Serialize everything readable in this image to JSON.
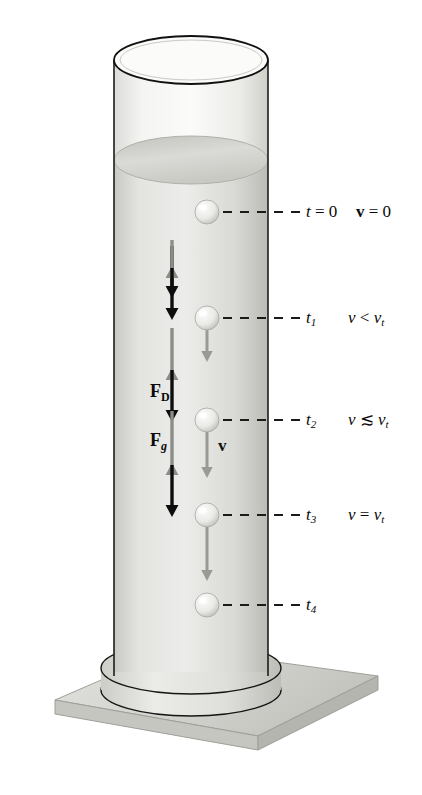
{
  "figure": {
    "colors": {
      "fluid_light": "#e9e9e7",
      "fluid_mid": "#d2d2ce",
      "fluid_dark": "#b9b9b4",
      "glass_outline": "#1c1c1c",
      "sphere_fill": "#f2f2ef",
      "sphere_shade": "#b3b3ad",
      "gravity_arrow": "#0d0d0d",
      "drag_arrow": "#8d8d88",
      "velocity_arrow": "#9a9a95",
      "base_top": "#d8d8d4",
      "base_side": "#bdbdb8",
      "dash_line": "#1a1a1a"
    }
  },
  "force_labels": [
    {
      "id": "drag",
      "name": "F_D",
      "symbol": "F",
      "subscript": "D",
      "subscript_italic": false,
      "direction": "up",
      "meaning": "drag force"
    },
    {
      "id": "gravity",
      "name": "F_g",
      "symbol": "F",
      "subscript": "g",
      "subscript_italic": true,
      "direction": "down",
      "meaning": "gravitational force"
    }
  ],
  "velocity_label": {
    "symbol": "v",
    "bold": true,
    "meaning": "instantaneous velocity vector"
  },
  "time_steps": [
    {
      "id": "t0",
      "time_label": "t = 0",
      "time_symbol": "t",
      "time_subscript": "",
      "time_value": "0",
      "speed_label": "v = 0",
      "speed_symbol": "v",
      "speed_relation": "=",
      "speed_value": "0",
      "speed_bold": true,
      "sphere_y": 212,
      "velocity_arrow_length": 0,
      "drag_arrow_length": 0,
      "gravity_arrow_length": 52,
      "note": "released from rest at the fluid surface"
    },
    {
      "id": "t1",
      "time_label": "t1",
      "time_symbol": "t",
      "time_subscript": "1",
      "time_value": "",
      "speed_label": "v < vt",
      "speed_symbol": "v",
      "speed_relation": "<",
      "speed_value": "vt",
      "speed_bold": false,
      "sphere_y": 318,
      "velocity_arrow_length": 34,
      "drag_arrow_length": 26,
      "gravity_arrow_length": 52,
      "note": "accelerating, drag smaller than gravity"
    },
    {
      "id": "t2",
      "time_label": "t2",
      "time_symbol": "t",
      "time_subscript": "2",
      "time_value": "",
      "speed_label": "v ≲ vt",
      "speed_symbol": "v",
      "speed_relation": "≲",
      "speed_value": "vt",
      "speed_bold": false,
      "sphere_y": 420,
      "velocity_arrow_length": 48,
      "drag_arrow_length": 40,
      "gravity_arrow_length": 52,
      "note": "approaching terminal speed"
    },
    {
      "id": "t3",
      "time_label": "t3",
      "time_symbol": "t",
      "time_subscript": "3",
      "time_value": "",
      "speed_label": "v = vt",
      "speed_symbol": "v",
      "speed_relation": "=",
      "speed_value": "vt",
      "speed_bold": false,
      "sphere_y": 515,
      "velocity_arrow_length": 56,
      "drag_arrow_length": 52,
      "gravity_arrow_length": 52,
      "note": "terminal velocity, forces balanced"
    },
    {
      "id": "t4",
      "time_label": "t4",
      "time_symbol": "t",
      "time_subscript": "4",
      "time_value": "",
      "speed_label": "",
      "speed_symbol": "",
      "speed_relation": "",
      "speed_value": "",
      "speed_bold": false,
      "sphere_y": 605,
      "velocity_arrow_length": 0,
      "drag_arrow_length": 0,
      "gravity_arrow_length": 0,
      "note": "near the bottom of the cylinder"
    }
  ],
  "terminal_symbol": {
    "base": "v",
    "subscript": "t"
  }
}
